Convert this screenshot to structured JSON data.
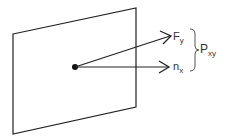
{
  "diagram": {
    "labels": {
      "force_main": "F",
      "force_sub": "y",
      "normal_main": "n",
      "normal_sub": "x",
      "plane_main": "P",
      "plane_sub": "xy"
    },
    "colors": {
      "stroke": "#222222",
      "text": "#333333",
      "background": "#ffffff"
    }
  }
}
